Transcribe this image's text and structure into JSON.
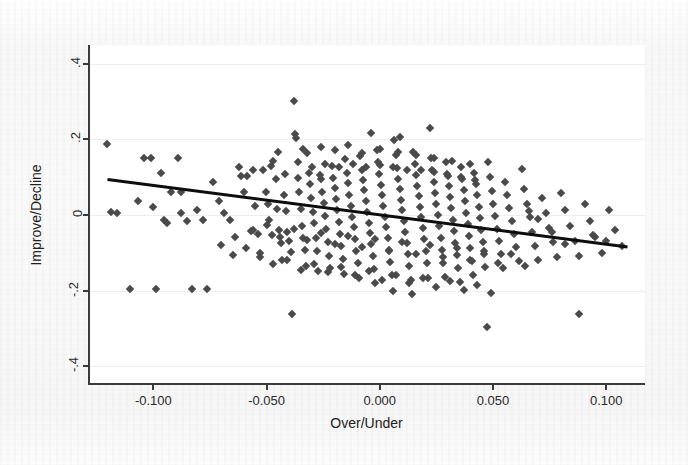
{
  "chart_data": {
    "type": "scatter",
    "title": "",
    "xlabel": "Over/Under",
    "ylabel": "Improve/Decline",
    "xlim": [
      -0.128,
      0.118
    ],
    "ylim": [
      -0.45,
      0.45
    ],
    "grid": true,
    "legend": null,
    "xticks": [
      -0.1,
      -0.05,
      0.0,
      0.05,
      0.1
    ],
    "xtick_labels": [
      "-0.100",
      "-0.050",
      "0.000",
      "0.050",
      "0.100"
    ],
    "yticks": [
      0.4,
      0.2,
      0.0,
      -0.2,
      -0.4
    ],
    "ytick_labels": [
      ".4",
      ".2",
      "0",
      "-.2",
      "-.4"
    ],
    "marker_shape": "diamond",
    "marker_color": "#4a4a4a",
    "fit_line": {
      "type": "linear",
      "color": "#0d0d0d",
      "width": 3,
      "x_start": -0.1205,
      "y_start": 0.092,
      "x_end": 0.1105,
      "y_end": -0.088
    },
    "points": [
      [
        -0.1205,
        0.188
      ],
      [
        -0.1188,
        0.008
      ],
      [
        -0.1162,
        0.005
      ],
      [
        -0.1105,
        -0.196
      ],
      [
        -0.107,
        0.038
      ],
      [
        -0.1042,
        0.152
      ],
      [
        -0.101,
        0.152
      ],
      [
        -0.0988,
        -0.196
      ],
      [
        -0.0965,
        0.11
      ],
      [
        -0.0952,
        -0.012
      ],
      [
        -0.0922,
        0.06
      ],
      [
        -0.089,
        0.152
      ],
      [
        -0.0878,
        0.06
      ],
      [
        -0.085,
        -0.016
      ],
      [
        -0.083,
        -0.196
      ],
      [
        -0.0806,
        0.012
      ],
      [
        -0.078,
        -0.012
      ],
      [
        -0.0762,
        -0.196
      ],
      [
        -0.0736,
        0.088
      ],
      [
        -0.0712,
        0.038
      ],
      [
        -0.0688,
        0.006
      ],
      [
        -0.0662,
        -0.014
      ],
      [
        -0.064,
        -0.058
      ],
      [
        -0.0612,
        0.102
      ],
      [
        -0.06,
        0.06
      ],
      [
        -0.0586,
        0.102
      ],
      [
        -0.057,
        -0.042
      ],
      [
        -0.0552,
        0.024
      ],
      [
        -0.054,
        -0.05
      ],
      [
        -0.0528,
        -0.1
      ],
      [
        -0.0516,
        0.12
      ],
      [
        -0.0502,
        0.062
      ],
      [
        -0.0494,
        0.03
      ],
      [
        -0.0488,
        -0.014
      ],
      [
        -0.0478,
        -0.052
      ],
      [
        -0.047,
        0.144
      ],
      [
        -0.046,
        0.096
      ],
      [
        -0.0452,
        0.016
      ],
      [
        -0.0444,
        -0.04
      ],
      [
        -0.0438,
        -0.075
      ],
      [
        -0.043,
        -0.12
      ],
      [
        -0.0424,
        0.052
      ],
      [
        -0.0416,
        0.01
      ],
      [
        -0.0408,
        -0.046
      ],
      [
        -0.04,
        -0.07
      ],
      [
        -0.0394,
        -0.098
      ],
      [
        -0.0386,
        -0.262
      ],
      [
        -0.038,
        0.302
      ],
      [
        -0.0374,
        0.214
      ],
      [
        -0.0368,
        0.204
      ],
      [
        -0.0362,
        0.098
      ],
      [
        -0.0356,
        0.062
      ],
      [
        -0.035,
        0.016
      ],
      [
        -0.0344,
        -0.028
      ],
      [
        -0.0338,
        -0.06
      ],
      [
        -0.0332,
        -0.092
      ],
      [
        -0.0326,
        -0.134
      ],
      [
        -0.032,
        0.164
      ],
      [
        -0.0314,
        0.112
      ],
      [
        -0.0308,
        0.082
      ],
      [
        -0.0302,
        0.046
      ],
      [
        -0.0296,
        0.008
      ],
      [
        -0.029,
        -0.022
      ],
      [
        -0.0284,
        -0.062
      ],
      [
        -0.0278,
        -0.096
      ],
      [
        -0.0272,
        -0.148
      ],
      [
        -0.0266,
        0.106
      ],
      [
        -0.026,
        0.094
      ],
      [
        -0.0254,
        0.062
      ],
      [
        -0.0248,
        0.032
      ],
      [
        -0.0242,
        -0.002
      ],
      [
        -0.0236,
        -0.038
      ],
      [
        -0.023,
        -0.072
      ],
      [
        -0.0224,
        -0.108
      ],
      [
        -0.0218,
        -0.14
      ],
      [
        -0.0212,
        0.13
      ],
      [
        -0.0206,
        0.098
      ],
      [
        -0.02,
        0.072
      ],
      [
        -0.0194,
        0.042
      ],
      [
        -0.0188,
        0.012
      ],
      [
        -0.0182,
        -0.018
      ],
      [
        -0.0176,
        -0.05
      ],
      [
        -0.017,
        -0.082
      ],
      [
        -0.0164,
        -0.116
      ],
      [
        -0.0158,
        -0.156
      ],
      [
        -0.0152,
        0.148
      ],
      [
        -0.0146,
        0.11
      ],
      [
        -0.014,
        0.086
      ],
      [
        -0.0134,
        0.054
      ],
      [
        -0.0128,
        0.024
      ],
      [
        -0.0122,
        -0.004
      ],
      [
        -0.0116,
        -0.032
      ],
      [
        -0.011,
        -0.064
      ],
      [
        -0.0104,
        -0.096
      ],
      [
        -0.0098,
        -0.128
      ],
      [
        -0.0092,
        -0.168
      ],
      [
        -0.0086,
        0.156
      ],
      [
        -0.008,
        0.12
      ],
      [
        -0.0074,
        0.092
      ],
      [
        -0.0068,
        0.066
      ],
      [
        -0.0062,
        0.036
      ],
      [
        -0.0056,
        0.008
      ],
      [
        -0.005,
        -0.02
      ],
      [
        -0.0044,
        -0.048
      ],
      [
        -0.0038,
        -0.078
      ],
      [
        -0.0032,
        -0.108
      ],
      [
        -0.0026,
        -0.144
      ],
      [
        -0.002,
        -0.18
      ],
      [
        -0.0014,
        0.172
      ],
      [
        -0.0008,
        0.14
      ],
      [
        -0.0002,
        0.108
      ],
      [
        0.0004,
        0.08
      ],
      [
        0.001,
        0.052
      ],
      [
        0.0016,
        0.024
      ],
      [
        0.0022,
        -0.004
      ],
      [
        0.0028,
        -0.032
      ],
      [
        0.0034,
        -0.062
      ],
      [
        0.004,
        -0.092
      ],
      [
        0.0046,
        -0.124
      ],
      [
        0.0052,
        -0.16
      ],
      [
        0.0058,
        -0.2
      ],
      [
        0.0064,
        0.198
      ],
      [
        0.007,
        0.158
      ],
      [
        0.0076,
        0.124
      ],
      [
        0.0082,
        0.096
      ],
      [
        0.0088,
        0.068
      ],
      [
        0.0094,
        0.04
      ],
      [
        0.01,
        0.012
      ],
      [
        0.0106,
        -0.016
      ],
      [
        0.0112,
        -0.044
      ],
      [
        0.0118,
        -0.074
      ],
      [
        0.0124,
        -0.104
      ],
      [
        0.013,
        -0.136
      ],
      [
        0.0136,
        -0.172
      ],
      [
        0.0142,
        -0.21
      ],
      [
        0.0148,
        0.168
      ],
      [
        0.0154,
        0.136
      ],
      [
        0.016,
        0.106
      ],
      [
        0.0166,
        0.078
      ],
      [
        0.0172,
        0.05
      ],
      [
        0.0178,
        0.022
      ],
      [
        0.0184,
        -0.006
      ],
      [
        0.019,
        -0.034
      ],
      [
        0.0196,
        -0.064
      ],
      [
        0.0202,
        -0.096
      ],
      [
        0.0208,
        -0.128
      ],
      [
        0.0214,
        -0.166
      ],
      [
        0.022,
        0.23
      ],
      [
        0.0226,
        0.152
      ],
      [
        0.0232,
        0.118
      ],
      [
        0.0238,
        0.088
      ],
      [
        0.0244,
        0.058
      ],
      [
        0.025,
        0.03
      ],
      [
        0.0256,
        0.0
      ],
      [
        0.0262,
        -0.03
      ],
      [
        0.0268,
        -0.06
      ],
      [
        0.0274,
        -0.092
      ],
      [
        0.028,
        -0.126
      ],
      [
        0.0286,
        -0.164
      ],
      [
        0.0292,
        0.14
      ],
      [
        0.0298,
        0.108
      ],
      [
        0.0304,
        0.078
      ],
      [
        0.031,
        0.048
      ],
      [
        0.0316,
        0.018
      ],
      [
        0.0322,
        -0.012
      ],
      [
        0.0328,
        -0.042
      ],
      [
        0.0334,
        -0.074
      ],
      [
        0.034,
        -0.106
      ],
      [
        0.0346,
        -0.14
      ],
      [
        0.0352,
        -0.178
      ],
      [
        0.0358,
        0.126
      ],
      [
        0.0364,
        0.096
      ],
      [
        0.037,
        0.066
      ],
      [
        0.0376,
        0.036
      ],
      [
        0.0382,
        0.006
      ],
      [
        0.0388,
        -0.024
      ],
      [
        0.0394,
        -0.056
      ],
      [
        0.04,
        -0.088
      ],
      [
        0.0406,
        -0.122
      ],
      [
        0.0412,
        -0.158
      ],
      [
        0.0418,
        0.112
      ],
      [
        0.0424,
        0.082
      ],
      [
        0.043,
        0.052
      ],
      [
        0.0436,
        0.022
      ],
      [
        0.0442,
        -0.008
      ],
      [
        0.0448,
        -0.04
      ],
      [
        0.0454,
        -0.072
      ],
      [
        0.046,
        -0.104
      ],
      [
        0.0466,
        -0.138
      ],
      [
        0.0472,
        -0.296
      ],
      [
        0.0478,
        0.14
      ],
      [
        0.0486,
        0.1
      ],
      [
        0.0494,
        0.064
      ],
      [
        0.0502,
        0.03
      ],
      [
        0.051,
        -0.002
      ],
      [
        0.0518,
        -0.036
      ],
      [
        0.0526,
        -0.07
      ],
      [
        0.0534,
        -0.104
      ],
      [
        0.0542,
        -0.14
      ],
      [
        0.0552,
        0.088
      ],
      [
        0.0562,
        0.052
      ],
      [
        0.0572,
        0.018
      ],
      [
        0.0582,
        -0.016
      ],
      [
        0.0592,
        -0.05
      ],
      [
        0.0602,
        -0.086
      ],
      [
        0.0614,
        -0.122
      ],
      [
        0.0626,
        0.122
      ],
      [
        0.0638,
        0.07
      ],
      [
        0.065,
        0.03
      ],
      [
        0.0662,
        -0.006
      ],
      [
        0.0674,
        -0.044
      ],
      [
        0.0686,
        -0.082
      ],
      [
        0.07,
        -0.12
      ],
      [
        0.0716,
        0.046
      ],
      [
        0.0732,
        0.006
      ],
      [
        0.0748,
        -0.034
      ],
      [
        0.0764,
        -0.072
      ],
      [
        0.0782,
        -0.11
      ],
      [
        0.08,
        0.058
      ],
      [
        0.082,
        0.012
      ],
      [
        0.084,
        -0.028
      ],
      [
        0.086,
        -0.068
      ],
      [
        0.088,
        -0.108
      ],
      [
        0.088,
        -0.262
      ],
      [
        0.0904,
        0.03
      ],
      [
        0.0928,
        -0.016
      ],
      [
        0.0952,
        -0.058
      ],
      [
        0.098,
        -0.1
      ],
      [
        0.101,
        0.014
      ],
      [
        0.104,
        -0.04
      ],
      [
        0.107,
        -0.082
      ],
      [
        -0.062,
        0.126
      ],
      [
        -0.056,
        0.118
      ],
      [
        -0.048,
        0.13
      ],
      [
        -0.042,
        0.108
      ],
      [
        -0.036,
        0.14
      ],
      [
        -0.03,
        0.126
      ],
      [
        -0.024,
        0.136
      ],
      [
        -0.018,
        0.128
      ],
      [
        -0.012,
        0.134
      ],
      [
        -0.006,
        0.126
      ],
      [
        0.0,
        0.132
      ],
      [
        0.006,
        0.128
      ],
      [
        0.012,
        0.12
      ],
      [
        0.018,
        0.118
      ],
      [
        0.024,
        0.114
      ],
      [
        0.03,
        0.104
      ],
      [
        0.036,
        0.1
      ],
      [
        0.042,
        0.092
      ],
      [
        -0.07,
        -0.08
      ],
      [
        -0.065,
        -0.106
      ],
      [
        -0.059,
        -0.088
      ],
      [
        -0.053,
        -0.112
      ],
      [
        -0.047,
        -0.13
      ],
      [
        -0.041,
        -0.118
      ],
      [
        -0.035,
        -0.146
      ],
      [
        -0.029,
        -0.13
      ],
      [
        -0.023,
        -0.152
      ],
      [
        -0.017,
        -0.138
      ],
      [
        -0.011,
        -0.16
      ],
      [
        -0.005,
        -0.148
      ],
      [
        0.001,
        -0.172
      ],
      [
        0.007,
        -0.158
      ],
      [
        0.013,
        -0.18
      ],
      [
        0.019,
        -0.166
      ],
      [
        0.025,
        -0.19
      ],
      [
        0.031,
        -0.176
      ],
      [
        0.037,
        -0.198
      ],
      [
        0.043,
        -0.184
      ],
      [
        0.049,
        -0.206
      ],
      [
        -0.026,
        0.18
      ],
      [
        -0.02,
        0.172
      ],
      [
        -0.014,
        0.186
      ],
      [
        -0.008,
        0.164
      ],
      [
        0.0,
        0.176
      ],
      [
        0.008,
        0.168
      ],
      [
        0.016,
        0.16
      ],
      [
        0.024,
        0.152
      ],
      [
        -0.045,
        0.168
      ],
      [
        -0.034,
        0.176
      ],
      [
        0.032,
        0.144
      ],
      [
        0.04,
        0.136
      ],
      [
        -0.056,
        -0.04
      ],
      [
        -0.05,
        -0.026
      ],
      [
        -0.044,
        -0.058
      ],
      [
        -0.038,
        -0.036
      ],
      [
        -0.032,
        -0.066
      ],
      [
        -0.026,
        -0.048
      ],
      [
        -0.02,
        -0.078
      ],
      [
        -0.014,
        -0.056
      ],
      [
        -0.008,
        -0.086
      ],
      [
        -0.002,
        -0.064
      ],
      [
        0.004,
        -0.094
      ],
      [
        0.01,
        -0.072
      ],
      [
        0.016,
        -0.102
      ],
      [
        0.022,
        -0.08
      ],
      [
        0.028,
        -0.11
      ],
      [
        0.034,
        -0.088
      ],
      [
        0.04,
        -0.118
      ],
      [
        0.046,
        -0.096
      ],
      [
        0.052,
        -0.126
      ],
      [
        0.058,
        -0.104
      ],
      [
        0.064,
        -0.134
      ],
      [
        -0.088,
        0.006
      ],
      [
        -0.094,
        -0.02
      ],
      [
        -0.1,
        0.02
      ],
      [
        0.07,
        -0.01
      ],
      [
        0.076,
        -0.044
      ],
      [
        0.082,
        -0.076
      ],
      [
        0.094,
        -0.052
      ],
      [
        0.1,
        -0.07
      ],
      [
        0.066,
        0.01
      ],
      [
        -0.004,
        0.218
      ],
      [
        0.009,
        0.206
      ]
    ]
  },
  "axes": {
    "x_title": "Over/Under",
    "y_title": "Improve/Decline"
  }
}
